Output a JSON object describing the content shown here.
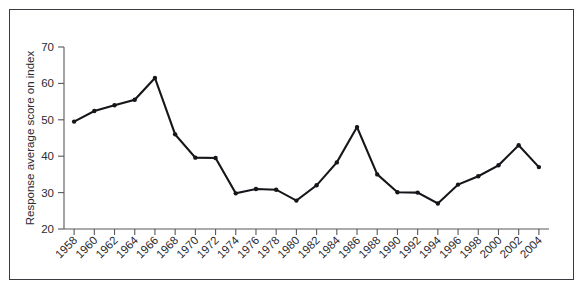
{
  "chart_data": {
    "type": "line",
    "title": "",
    "xlabel": "",
    "ylabel": "Response average score on index",
    "ylim": [
      20,
      70
    ],
    "yticks": [
      20,
      30,
      40,
      50,
      60,
      70
    ],
    "grid": false,
    "legend": false,
    "marker": "filled-circle",
    "line_color": "#15151a",
    "categories": [
      "1958",
      "1960",
      "1962",
      "1964",
      "1966",
      "1968",
      "1970",
      "1972",
      "1974",
      "1976",
      "1978",
      "1980",
      "1982",
      "1984",
      "1986",
      "1988",
      "1990",
      "1992",
      "1994",
      "1996",
      "1998",
      "2000",
      "2002",
      "2004"
    ],
    "values": [
      49.5,
      52.4,
      54.0,
      55.5,
      61.5,
      46.0,
      39.6,
      39.5,
      29.8,
      31.0,
      30.8,
      27.8,
      32.0,
      38.3,
      48.0,
      35.0,
      30.1,
      30.0,
      27.0,
      32.2,
      34.5,
      37.5,
      43.0,
      37.0
    ],
    "series": [
      {
        "name": "Response average score on index",
        "values": [
          49.5,
          52.4,
          54.0,
          55.5,
          61.5,
          46.0,
          39.6,
          39.5,
          29.8,
          31.0,
          30.8,
          27.8,
          32.0,
          38.3,
          48.0,
          35.0,
          30.1,
          30.0,
          27.0,
          32.2,
          34.5,
          37.5,
          43.0,
          37.0
        ]
      }
    ]
  }
}
